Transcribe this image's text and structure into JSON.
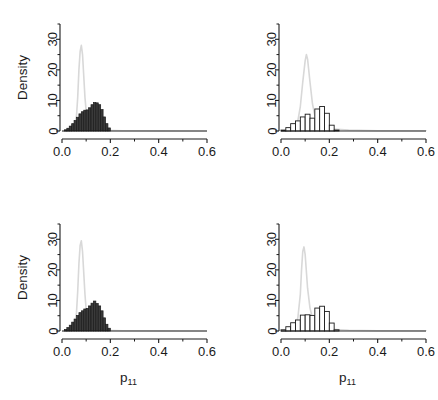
{
  "figure": {
    "background_color": "#ffffff",
    "rows": 2,
    "cols": 2,
    "width": 438,
    "height": 400
  },
  "axis": {
    "y_title": "Density",
    "x_title_base": "p",
    "x_title_sub": "11",
    "x_ticks": [
      "0.0",
      "0.2",
      "0.4",
      "0.6"
    ],
    "x_tick_values": [
      0.0,
      0.2,
      0.4,
      0.6
    ],
    "y_ticks": [
      "0",
      "10",
      "20",
      "30"
    ],
    "y_tick_values": [
      0,
      10,
      20,
      30
    ],
    "xlim": [
      0,
      0.6
    ],
    "ylim": [
      0,
      35
    ],
    "grid": "off",
    "legend": "none",
    "axis_color": "#1a1a1a",
    "hist_outline_color": "#1a1a1a",
    "hist_fill_left": "#3a3a3a",
    "hist_fill_right": "#ffffff",
    "density_curve_color": "#d8d8d8"
  },
  "chart_data": [
    {
      "type": "bar",
      "panel": "top-left",
      "title": "",
      "xlabel": "",
      "ylabel": "Density",
      "xlim": [
        0,
        0.6
      ],
      "ylim": [
        0,
        35
      ],
      "grid": false,
      "bin_width": 0.01,
      "bin_starts": [
        0.01,
        0.02,
        0.03,
        0.04,
        0.05,
        0.06,
        0.07,
        0.08,
        0.09,
        0.1,
        0.11,
        0.12,
        0.13,
        0.14,
        0.15,
        0.16,
        0.17,
        0.18,
        0.19
      ],
      "values": [
        0.4,
        0.9,
        1.6,
        2.4,
        3.4,
        4.5,
        5.6,
        6.3,
        6.8,
        6.9,
        7.6,
        8.6,
        9.3,
        9.2,
        8.6,
        7.0,
        4.6,
        2.4,
        1.0
      ],
      "series": [
        {
          "name": "histogram",
          "values": [
            0.4,
            0.9,
            1.6,
            2.4,
            3.4,
            4.5,
            5.6,
            6.3,
            6.8,
            6.9,
            7.6,
            8.6,
            9.3,
            9.2,
            8.6,
            7.0,
            4.6,
            2.4,
            1.0
          ]
        },
        {
          "name": "density-curve",
          "x": [
            0.04,
            0.05,
            0.06,
            0.065,
            0.07,
            0.075,
            0.08,
            0.085,
            0.09,
            0.095,
            0.1,
            0.11,
            0.12,
            0.14,
            0.18,
            0.25,
            0.4,
            0.6
          ],
          "values": [
            0.2,
            1.0,
            5.0,
            11.0,
            20.0,
            26.0,
            28.0,
            25.0,
            18.0,
            11.0,
            6.5,
            2.5,
            1.2,
            0.5,
            0.2,
            0.1,
            0.05,
            0.02
          ],
          "peak_x": 0.08,
          "peak_y": 28
        }
      ]
    },
    {
      "type": "bar",
      "panel": "top-right",
      "title": "",
      "xlabel": "",
      "ylabel": "Density",
      "xlim": [
        0,
        0.6
      ],
      "ylim": [
        0,
        35
      ],
      "grid": false,
      "bin_width": 0.02,
      "bin_starts": [
        0.0,
        0.02,
        0.04,
        0.06,
        0.08,
        0.1,
        0.12,
        0.14,
        0.16,
        0.18,
        0.2,
        0.22
      ],
      "values": [
        0.3,
        1.1,
        2.4,
        3.3,
        4.6,
        5.5,
        4.2,
        7.2,
        8.0,
        5.8,
        1.9,
        0.3
      ],
      "series": [
        {
          "name": "histogram",
          "values": [
            0.3,
            1.1,
            2.4,
            3.3,
            4.6,
            5.5,
            4.2,
            7.2,
            8.0,
            5.8,
            1.9,
            0.3
          ]
        },
        {
          "name": "density-curve",
          "x": [
            0.05,
            0.06,
            0.07,
            0.08,
            0.09,
            0.1,
            0.105,
            0.11,
            0.12,
            0.13,
            0.14,
            0.16,
            0.2,
            0.28,
            0.4,
            0.6
          ],
          "values": [
            0.3,
            1.2,
            3.5,
            8.0,
            16.0,
            23.0,
            25.0,
            23.5,
            16.0,
            9.0,
            5.0,
            2.0,
            0.7,
            0.3,
            0.1,
            0.05
          ],
          "peak_x": 0.105,
          "peak_y": 25
        }
      ]
    },
    {
      "type": "bar",
      "panel": "bottom-left",
      "title": "",
      "xlabel": "p11",
      "ylabel": "Density",
      "xlim": [
        0,
        0.6
      ],
      "ylim": [
        0,
        35
      ],
      "grid": false,
      "bin_width": 0.01,
      "bin_starts": [
        0.01,
        0.02,
        0.03,
        0.04,
        0.05,
        0.06,
        0.07,
        0.08,
        0.09,
        0.1,
        0.11,
        0.12,
        0.13,
        0.14,
        0.15,
        0.16,
        0.17,
        0.18,
        0.19
      ],
      "values": [
        0.5,
        1.1,
        1.9,
        2.9,
        3.9,
        5.1,
        6.0,
        6.6,
        7.2,
        7.4,
        8.2,
        9.1,
        9.8,
        9.0,
        8.2,
        6.6,
        4.3,
        2.2,
        0.9
      ],
      "series": [
        {
          "name": "histogram",
          "values": [
            0.5,
            1.1,
            1.9,
            2.9,
            3.9,
            5.1,
            6.0,
            6.6,
            7.2,
            7.4,
            8.2,
            9.1,
            9.8,
            9.0,
            8.2,
            6.6,
            4.3,
            2.2,
            0.9
          ]
        },
        {
          "name": "density-curve",
          "x": [
            0.04,
            0.05,
            0.06,
            0.065,
            0.07,
            0.075,
            0.08,
            0.085,
            0.09,
            0.095,
            0.1,
            0.11,
            0.12,
            0.14,
            0.18,
            0.25,
            0.4,
            0.6
          ],
          "values": [
            0.2,
            1.2,
            6.0,
            13.0,
            22.0,
            28.0,
            29.5,
            26.0,
            19.0,
            12.0,
            7.0,
            2.6,
            1.2,
            0.5,
            0.2,
            0.1,
            0.05,
            0.02
          ],
          "peak_x": 0.08,
          "peak_y": 29.5
        }
      ]
    },
    {
      "type": "bar",
      "panel": "bottom-right",
      "title": "",
      "xlabel": "p11",
      "ylabel": "Density",
      "xlim": [
        0,
        0.6
      ],
      "ylim": [
        0,
        35
      ],
      "grid": false,
      "bin_width": 0.02,
      "bin_starts": [
        0.0,
        0.02,
        0.04,
        0.06,
        0.08,
        0.1,
        0.12,
        0.14,
        0.16,
        0.18,
        0.2,
        0.22
      ],
      "values": [
        0.4,
        1.4,
        2.7,
        3.6,
        5.2,
        5.3,
        5.1,
        7.5,
        8.1,
        6.4,
        2.6,
        0.4
      ],
      "series": [
        {
          "name": "histogram",
          "values": [
            0.4,
            1.4,
            2.7,
            3.6,
            5.2,
            5.3,
            5.1,
            7.5,
            8.1,
            6.4,
            2.6,
            0.4
          ]
        },
        {
          "name": "density-curve",
          "x": [
            0.05,
            0.06,
            0.07,
            0.08,
            0.085,
            0.09,
            0.095,
            0.1,
            0.11,
            0.12,
            0.13,
            0.15,
            0.19,
            0.28,
            0.4,
            0.6
          ],
          "values": [
            0.3,
            1.4,
            4.5,
            12.0,
            20.0,
            26.0,
            27.5,
            25.0,
            14.0,
            7.5,
            4.2,
            1.8,
            0.6,
            0.25,
            0.1,
            0.05
          ],
          "peak_x": 0.095,
          "peak_y": 27.5
        }
      ]
    }
  ]
}
